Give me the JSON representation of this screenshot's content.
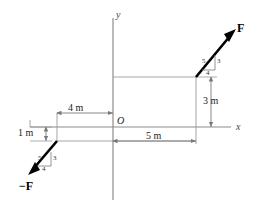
{
  "figure": {
    "type": "free-body-couple-diagram",
    "axes": {
      "x_label": "x",
      "y_label": "y",
      "origin_label": "O"
    },
    "dimensions": [
      {
        "name": "left-horizontal",
        "label": "4 m",
        "value": 4,
        "unit": "m"
      },
      {
        "name": "left-vertical",
        "label": "1 m",
        "value": 1,
        "unit": "m"
      },
      {
        "name": "right-vertical",
        "label": "3 m",
        "value": 3,
        "unit": "m"
      },
      {
        "name": "right-horizontal",
        "label": "5 m",
        "value": 5,
        "unit": "m"
      }
    ],
    "forces": [
      {
        "name": "force-positive",
        "label": "F",
        "application_point": [
          5,
          3
        ],
        "direction": "up-right",
        "slope_triangle": {
          "hypotenuse": "5",
          "vertical": "3",
          "horizontal": "4"
        }
      },
      {
        "name": "force-negative",
        "label": "−F",
        "application_point": [
          -4,
          -1
        ],
        "direction": "down-left",
        "slope_triangle": {
          "hypotenuse": "5",
          "vertical": "3",
          "horizontal": "4"
        }
      }
    ],
    "colors": {
      "axis": "#8c8c8c",
      "construction": "#9a9a9a",
      "force": "#000000",
      "text": "#1a1a1a"
    }
  }
}
